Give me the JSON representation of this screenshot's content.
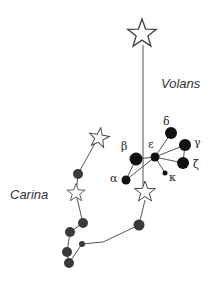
{
  "constellations": [
    {
      "name": "Volans",
      "label": "Volans"
    },
    {
      "name": "Carina",
      "label": "Carina"
    }
  ],
  "volans_stars": [
    {
      "greek": "α",
      "label": "α"
    },
    {
      "greek": "β",
      "label": "β"
    },
    {
      "greek": "γ",
      "label": "γ"
    },
    {
      "greek": "δ",
      "label": "δ"
    },
    {
      "greek": "ε",
      "label": "ε"
    },
    {
      "greek": "ζ",
      "label": "ζ"
    },
    {
      "greek": "κ",
      "label": "κ"
    }
  ],
  "colors": {
    "background": "#ffffff",
    "line": "#555555",
    "volans_star_fill": "#111111",
    "carina_star_fill": "#3a3a3a",
    "outline_star_stroke": "#444444",
    "text": "#333333"
  }
}
